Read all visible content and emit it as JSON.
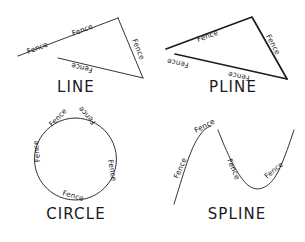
{
  "figure": {
    "title_visible": false,
    "background_color": "#ffffff",
    "stroke_color": "#1c1c22",
    "text_color": "#14141a",
    "width": 305,
    "height": 242
  },
  "panels": [
    {
      "id": "line",
      "caption": "LINE",
      "caption_x": 76,
      "caption_y": 92,
      "entity_type": "line",
      "stroke_width": 0.9,
      "paths": [
        "M 18 56 L 118 18",
        "M 118 18 L 143 78",
        "M 58 58 L 143 78"
      ],
      "labels": [
        {
          "text": "Fence",
          "x": 28,
          "y": 54,
          "rotate": -21
        },
        {
          "text": "Fence",
          "x": 73,
          "y": 36,
          "rotate": -21
        },
        {
          "text": "Fence",
          "x": 132,
          "y": 40,
          "rotate": 68
        },
        {
          "text": "Fence",
          "x": 93,
          "y": 68,
          "rotate": 193
        }
      ]
    },
    {
      "id": "pline",
      "caption": "PLINE",
      "caption_x": 233,
      "caption_y": 92,
      "entity_type": "polyline",
      "stroke_width": 1.7,
      "paths": [
        "M 166 49 L 252 17 L 287 79",
        "M 175 54 L 287 79"
      ],
      "labels": [
        {
          "text": "Fence",
          "x": 198,
          "y": 42,
          "rotate": -20
        },
        {
          "text": "Fence",
          "x": 266,
          "y": 36,
          "rotate": 62
        },
        {
          "text": "Fence",
          "x": 189,
          "y": 63,
          "rotate": 192
        },
        {
          "text": "Fence",
          "x": 250,
          "y": 76,
          "rotate": 192
        }
      ]
    },
    {
      "id": "circle",
      "caption": "CIRCLE",
      "caption_x": 76,
      "caption_y": 219,
      "entity_type": "circle",
      "stroke_width": 0.9,
      "center_x": 75.5,
      "center_y": 159,
      "radius": 41,
      "paths": [
        "M 75.5 118 A 41 41 0 1 1 75.4 118"
      ],
      "labels": [
        {
          "text": "Fence",
          "x": 52,
          "y": 127,
          "rotate": -46
        },
        {
          "text": "Fence",
          "x": 96,
          "y": 122,
          "rotate": 228
        },
        {
          "text": "Fence",
          "x": 40,
          "y": 162,
          "rotate": 265
        },
        {
          "text": "Fence",
          "x": 108,
          "y": 160,
          "rotate": 80
        },
        {
          "text": "Fence",
          "x": 62,
          "y": 195,
          "rotate": 16
        }
      ]
    },
    {
      "id": "spline",
      "caption": "SPLINE",
      "caption_x": 237,
      "caption_y": 219,
      "entity_type": "spline",
      "stroke_width": 0.9,
      "paths": [
        "M 174 204 C 183 176 190 148 200 135 C 204 129 208 127 211 126",
        "M 218 130 C 226 151 238 178 249 186 C 259 193 271 187 279 170 C 285 157 290 142 294 130"
      ],
      "labels": [
        {
          "text": "Fence",
          "x": 178,
          "y": 179,
          "rotate": -66
        },
        {
          "text": "Fence",
          "x": 196,
          "y": 133,
          "rotate": -28
        },
        {
          "text": "Fence",
          "x": 227,
          "y": 160,
          "rotate": 67
        },
        {
          "text": "Fence",
          "x": 267,
          "y": 179,
          "rotate": -40
        }
      ]
    }
  ],
  "labels_summary": {
    "fence_word": "Fence",
    "fence_label_count": 17,
    "captions": [
      "LINE",
      "PLINE",
      "CIRCLE",
      "SPLINE"
    ]
  }
}
